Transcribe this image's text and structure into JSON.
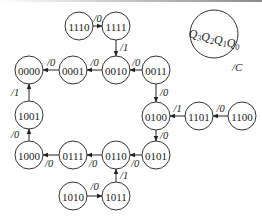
{
  "diagram": {
    "type": "state-transition-diagram",
    "legend": {
      "state_label": "Q3Q2Q1Q0",
      "state_label_parts": [
        {
          "base": "Q",
          "sub": "3"
        },
        {
          "base": "Q",
          "sub": "2"
        },
        {
          "base": "Q",
          "sub": "1"
        },
        {
          "base": "Q",
          "sub": "0"
        }
      ],
      "output_label": "/C"
    },
    "states": [
      {
        "id": "1110",
        "label": "1110",
        "cx": 79,
        "cy": 26
      },
      {
        "id": "1111",
        "label": "1111",
        "cx": 116,
        "cy": 26
      },
      {
        "id": "0000",
        "label": "0000",
        "cx": 29,
        "cy": 70
      },
      {
        "id": "0001",
        "label": "0001",
        "cx": 73,
        "cy": 70
      },
      {
        "id": "0010",
        "label": "0010",
        "cx": 116,
        "cy": 70
      },
      {
        "id": "0011",
        "label": "0011",
        "cx": 156,
        "cy": 70
      },
      {
        "id": "0100",
        "label": "0100",
        "cx": 156,
        "cy": 116
      },
      {
        "id": "1101",
        "label": "1101",
        "cx": 199,
        "cy": 116
      },
      {
        "id": "1100",
        "label": "1100",
        "cx": 242,
        "cy": 116
      },
      {
        "id": "1001",
        "label": "1001",
        "cx": 29,
        "cy": 115
      },
      {
        "id": "1000",
        "label": "1000",
        "cx": 29,
        "cy": 155
      },
      {
        "id": "0111",
        "label": "0111",
        "cx": 73,
        "cy": 155
      },
      {
        "id": "0110",
        "label": "0110",
        "cx": 116,
        "cy": 155
      },
      {
        "id": "0101",
        "label": "0101",
        "cx": 156,
        "cy": 155
      },
      {
        "id": "1010",
        "label": "1010",
        "cx": 73,
        "cy": 196
      },
      {
        "id": "1011",
        "label": "1011",
        "cx": 116,
        "cy": 196
      }
    ],
    "transitions": [
      {
        "from": "1110",
        "to": "1111",
        "label": "/0"
      },
      {
        "from": "1111",
        "to": "0010",
        "label": "/1"
      },
      {
        "from": "0001",
        "to": "0000",
        "label": "/0"
      },
      {
        "from": "0010",
        "to": "0001",
        "label": "/0"
      },
      {
        "from": "0011",
        "to": "0010",
        "label": "/0"
      },
      {
        "from": "0011",
        "to": "0100",
        "label": "/0"
      },
      {
        "from": "1101",
        "to": "0100",
        "label": "/1"
      },
      {
        "from": "1100",
        "to": "1101",
        "label": "/0"
      },
      {
        "from": "0100",
        "to": "0101",
        "label": "/0"
      },
      {
        "from": "0101",
        "to": "0110",
        "label": "/0"
      },
      {
        "from": "0110",
        "to": "0111",
        "label": "/0"
      },
      {
        "from": "0111",
        "to": "1000",
        "label": "/0"
      },
      {
        "from": "1000",
        "to": "1001",
        "label": "/0"
      },
      {
        "from": "1001",
        "to": "0000",
        "label": "/1"
      },
      {
        "from": "1010",
        "to": "1011",
        "label": "/0"
      },
      {
        "from": "1011",
        "to": "0110",
        "label": "/1"
      }
    ]
  }
}
